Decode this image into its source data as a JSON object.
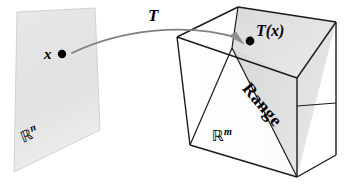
{
  "figure": {
    "domain_plane": {
      "label_symbol": "ℝ",
      "label_superscript": "n",
      "point_label": "x",
      "fill_color": "#e3e3e3",
      "stroke_color": "#bdbdbd"
    },
    "codomain_cube": {
      "label_symbol": "ℝ",
      "label_superscript": "m",
      "fill_color": "#ffffff",
      "stroke_color": "#1a1a1a",
      "range_plane_label": "Range",
      "range_plane_fill": "#dcdcdc",
      "image_point_label": "T(x)"
    },
    "mapping_arrow": {
      "label": "T",
      "stroke_color": "#7a7a7a",
      "arrowhead_color": "#8c8c8c"
    },
    "point_color": "#000000"
  }
}
